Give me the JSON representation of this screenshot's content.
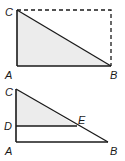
{
  "figures": [
    {
      "id": "top",
      "description": "Right triangle ABC shaded inside a dashed rectangle",
      "labels": {
        "C": "C",
        "A": "A",
        "B": "B"
      },
      "fill_color": "#ececec",
      "stroke_color": "#1a1a1a"
    },
    {
      "id": "bottom",
      "description": "Right triangle ABC with segment DE parallel to AB; triangle CDE shaded",
      "labels": {
        "C": "C",
        "D": "D",
        "E": "E",
        "A": "A",
        "B": "B"
      },
      "fill_color": "#ececec",
      "stroke_color": "#1a1a1a"
    }
  ]
}
